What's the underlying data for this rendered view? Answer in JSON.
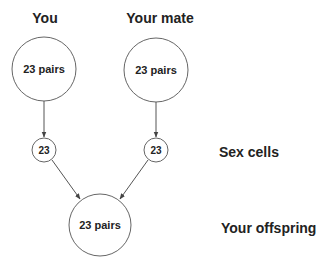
{
  "diagram": {
    "parents": [
      {
        "title": "You",
        "cell_label": "23 pairs",
        "gamete_label": "23"
      },
      {
        "title": "Your mate",
        "cell_label": "23 pairs",
        "gamete_label": "23"
      }
    ],
    "offspring": {
      "cell_label": "23 pairs"
    },
    "row_labels": {
      "sex_cells": "Sex cells",
      "offspring": "Your offspring"
    },
    "colors": {
      "stroke": "#666666",
      "text": "#222222"
    }
  }
}
